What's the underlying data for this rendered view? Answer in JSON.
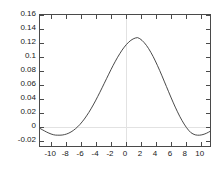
{
  "chart_data": {
    "type": "line",
    "title": "",
    "xlabel": "",
    "ylabel": "",
    "xlim": [
      -11.5,
      11.5
    ],
    "ylim": [
      -0.03,
      0.16
    ],
    "grid": false,
    "legend": null,
    "axis_box": true,
    "line_color": "#333333",
    "zero_line_color": "#e2e2e2",
    "xticks": [
      -10,
      -8,
      -6,
      -4,
      -2,
      0,
      2,
      4,
      6,
      8,
      10
    ],
    "xtick_labels": [
      "-10",
      "-8",
      "-6",
      "-4",
      "-2",
      "0",
      "2",
      "4",
      "6",
      "8",
      "10"
    ],
    "yticks": [
      -0.02,
      0,
      0.02,
      0.04,
      0.06,
      0.08,
      0.1,
      0.12,
      0.14,
      0.16
    ],
    "ytick_labels": [
      "-0.02",
      "0",
      "0.02",
      "0.04",
      "0.06",
      "0.08",
      "0.1",
      "0.12",
      "0.14",
      "0.16"
    ],
    "annotations": {
      "peak_value": 0.1457,
      "peak_x": 0,
      "trough_value": -0.0143,
      "trough_x_left": -8.7,
      "trough_x_right": 8.7
    },
    "series": [
      {
        "name": "signal",
        "x": [
          -11.5,
          -11.2,
          -10.9,
          -10.6,
          -10.3,
          -10.0,
          -9.7,
          -9.4,
          -9.1,
          -8.8,
          -8.5,
          -8.2,
          -7.9,
          -7.6,
          -7.3,
          -7.0,
          -6.7,
          -6.4,
          -6.1,
          -5.8,
          -5.5,
          -5.2,
          -4.9,
          -4.6,
          -4.3,
          -4.0,
          -3.7,
          -3.4,
          -3.1,
          -2.8,
          -2.5,
          -2.2,
          -1.9,
          -1.6,
          -1.3,
          -1.0,
          -0.7,
          -0.4,
          -0.1,
          0.2,
          0.5,
          0.8,
          1.1,
          1.4,
          1.7,
          2.0,
          2.3,
          2.6,
          2.9,
          3.2,
          3.5,
          3.8,
          4.1,
          4.4,
          4.7,
          5.0,
          5.3,
          5.6,
          5.9,
          6.2,
          6.5,
          6.8,
          7.1,
          7.4,
          7.7,
          8.0,
          8.3,
          8.6,
          8.9,
          9.2,
          9.5,
          9.8,
          10.1,
          10.4,
          10.7,
          11.0,
          11.3,
          11.5
        ],
        "y": [
          -0.0045,
          -0.0063,
          -0.0081,
          -0.0098,
          -0.0113,
          -0.0126,
          -0.0136,
          -0.0142,
          -0.0143,
          -0.0143,
          -0.0141,
          -0.0135,
          -0.0126,
          -0.0113,
          -0.0096,
          -0.0075,
          -0.005,
          -0.0021,
          0.0012,
          0.005,
          0.0091,
          0.0137,
          0.0186,
          0.0239,
          0.0295,
          0.0354,
          0.0416,
          0.0479,
          0.0544,
          0.061,
          0.0676,
          0.0742,
          0.0807,
          0.087,
          0.093,
          0.0987,
          0.104,
          0.109,
          0.1134,
          0.1173,
          0.1206,
          0.1233,
          0.1253,
          0.1266,
          0.1272,
          0.1257,
          0.1232,
          0.1199,
          0.1159,
          0.1112,
          0.1058,
          0.0999,
          0.0934,
          0.0865,
          0.0793,
          0.0718,
          0.0641,
          0.0564,
          0.0487,
          0.041,
          0.0336,
          0.0264,
          0.0196,
          0.0131,
          0.0072,
          0.0018,
          -0.003,
          -0.0071,
          -0.0105,
          -0.0125,
          -0.0138,
          -0.0143,
          -0.0143,
          -0.0138,
          -0.0129,
          -0.0116,
          -0.01,
          -0.0088
        ]
      }
    ]
  }
}
